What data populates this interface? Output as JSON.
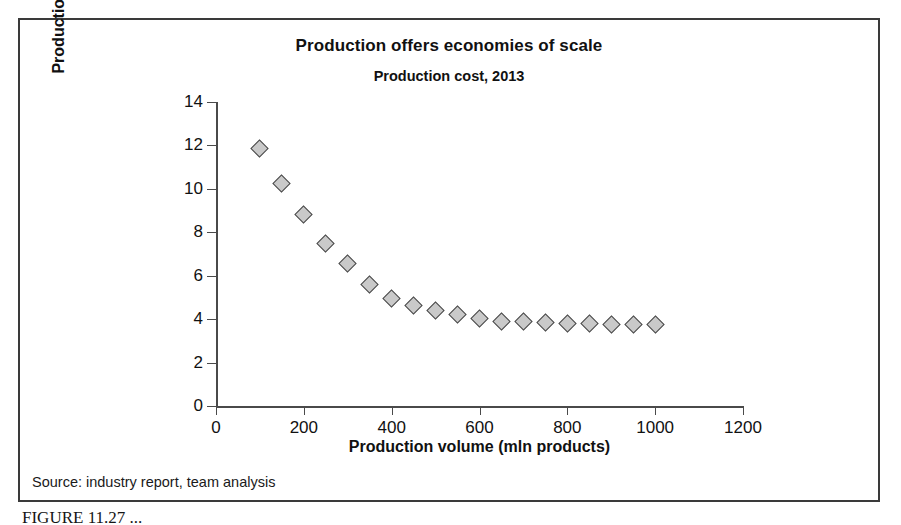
{
  "figure": {
    "source_note": "Source: industry report, team analysis",
    "caption": "FIGURE 11.27  ..."
  },
  "chart_data": {
    "type": "scatter",
    "title": "Production offers economies of scale",
    "subtitle": "Production cost, 2013",
    "xlabel": "Production volume (mln products)",
    "ylabel": "Production cost per product ($)",
    "xlim": [
      0,
      1200
    ],
    "ylim": [
      0,
      14
    ],
    "xticks": [
      0,
      200,
      400,
      600,
      800,
      1000,
      1200
    ],
    "yticks": [
      0,
      2,
      4,
      6,
      8,
      10,
      12,
      14
    ],
    "grid": false,
    "legend": null,
    "marker": {
      "shape": "diamond",
      "fill": "#c9c9c9",
      "stroke": "#4a4a4a"
    },
    "x": [
      100,
      150,
      200,
      250,
      300,
      350,
      400,
      450,
      500,
      550,
      600,
      650,
      700,
      750,
      800,
      850,
      900,
      950,
      1000
    ],
    "y": [
      11.85,
      10.25,
      8.8,
      7.5,
      6.55,
      5.6,
      4.95,
      4.65,
      4.4,
      4.2,
      4.05,
      3.9,
      3.9,
      3.85,
      3.8,
      3.8,
      3.75,
      3.75,
      3.75
    ]
  }
}
